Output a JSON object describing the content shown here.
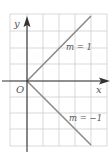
{
  "diagram": {
    "type": "coordinate-plane",
    "axes": {
      "x_label": "x",
      "y_label": "y",
      "origin_label": "O"
    },
    "grid": {
      "columns": 6,
      "rows": 8
    },
    "lines": [
      {
        "label": "m = 1",
        "slope": 1,
        "color": "#8a8a8a"
      },
      {
        "label": "m = −1",
        "slope": -1,
        "color": "#8a8a8a"
      }
    ]
  }
}
